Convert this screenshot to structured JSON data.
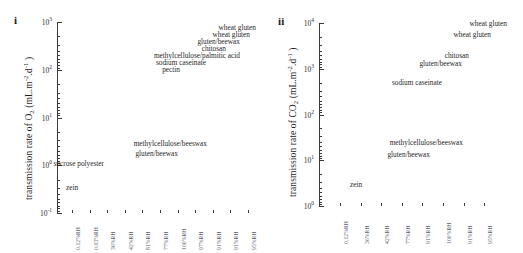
{
  "figure": {
    "background": "#ffffff",
    "text_color": "#1f1f1f",
    "tick_label_color": "#5a6070"
  },
  "chart_data": [
    {
      "type": "scatter",
      "panel_letter": "i",
      "title": "",
      "ylabel": "transmission rate of O₂ (mL.m⁻².d⁻¹)",
      "ylabel_parts": {
        "prefix": "transmission rate of O",
        "sub": "2",
        "mid": " (mL.m",
        "sup1": "-2",
        "mid2": ".d",
        "sup2": "-1",
        "suffix": " )"
      },
      "xlabel": "",
      "yscale": "log",
      "ylim": [
        0.1,
        1000
      ],
      "ytick_labels": [
        "10³",
        "10²",
        "10¹",
        "10⁰",
        "10⁻¹"
      ],
      "ytick_values": [
        1000,
        100,
        10,
        1,
        0.1
      ],
      "ytick_mantissa": [
        "10",
        "10",
        "10",
        "10",
        "10"
      ],
      "ytick_exponent": [
        "3",
        "2",
        "1",
        "0",
        "-1"
      ],
      "categories": [
        "0.12%RH",
        "0.03%RH",
        "36%RH",
        "42%RH",
        "81%RH",
        "77%RH",
        "100%RH",
        "97%RH",
        "91%RH",
        "91%RH",
        "95%RH"
      ],
      "grid": false,
      "legend": "none",
      "points": [
        {
          "label": "wheat gluten",
          "value": 350,
          "rh": "95%RH"
        },
        {
          "label": "wheat gluten",
          "value": 260,
          "rh": "91%RH"
        },
        {
          "label": "gluten/beewax",
          "value": 190,
          "rh": "91%RH"
        },
        {
          "label": "chitosan",
          "value": 140,
          "rh": "97%RH"
        },
        {
          "label": "methylcellulose/palmitic acid",
          "value": 100,
          "rh": "100%RH"
        },
        {
          "label": "sodium caseinate",
          "value": 72,
          "rh": "77%RH"
        },
        {
          "label": "pectin",
          "value": 55,
          "rh": "81%RH"
        },
        {
          "label": "methylcellulose/beeswax",
          "value": 4.5,
          "rh": "42%RH"
        },
        {
          "label": "gluten/beewax",
          "value": 3.2,
          "rh": "36%RH"
        },
        {
          "label": "sucrose polyester",
          "value": 1.7,
          "rh": "0.03%RH"
        },
        {
          "label": "zein",
          "value": 0.42,
          "rh": "0.12%RH"
        }
      ]
    },
    {
      "type": "scatter",
      "panel_letter": "ii",
      "title": "",
      "ylabel": "transmission rate of CO₂ (mL.m⁻².d⁻¹)",
      "ylabel_parts": {
        "prefix": "transmission rate of CO",
        "sub": "2",
        "mid": " (mL.m",
        "sup1": "-2",
        "mid2": ".d",
        "sup2": "-1",
        "suffix": " )"
      },
      "xlabel": "",
      "yscale": "log",
      "ylim": [
        1,
        10000
      ],
      "ytick_labels": [
        "10⁴",
        "10³",
        "10²",
        "10¹",
        "10⁰"
      ],
      "ytick_values": [
        10000,
        1000,
        100,
        10,
        1
      ],
      "ytick_mantissa": [
        "10",
        "10",
        "10",
        "10",
        "10"
      ],
      "ytick_exponent": [
        "4",
        "3",
        "2",
        "1",
        "0"
      ],
      "categories": [
        "0.12%RH",
        "36%RH",
        "42%RH",
        "77%RH",
        "91%RH",
        "100%RH",
        "91%RH",
        "95%RH"
      ],
      "grid": false,
      "legend": "none",
      "points": [
        {
          "label": "wheat gluten",
          "value": 7600,
          "rh": "95%RH"
        },
        {
          "label": "wheat gluten",
          "value": 4300,
          "rh": "91%RH"
        },
        {
          "label": "chitosan",
          "value": 1500,
          "rh": "100%RH"
        },
        {
          "label": "gluten/beewax",
          "value": 1150,
          "rh": "91%RH"
        },
        {
          "label": "sodium caseinate",
          "value": 420,
          "rh": "77%RH"
        },
        {
          "label": "methylcellulose/beeswax",
          "value": 25,
          "rh": "42%RH"
        },
        {
          "label": "gluten/beewax",
          "value": 16,
          "rh": "36%RH"
        },
        {
          "label": "zein",
          "value": 3.0,
          "rh": "0.12%RH"
        }
      ]
    }
  ]
}
